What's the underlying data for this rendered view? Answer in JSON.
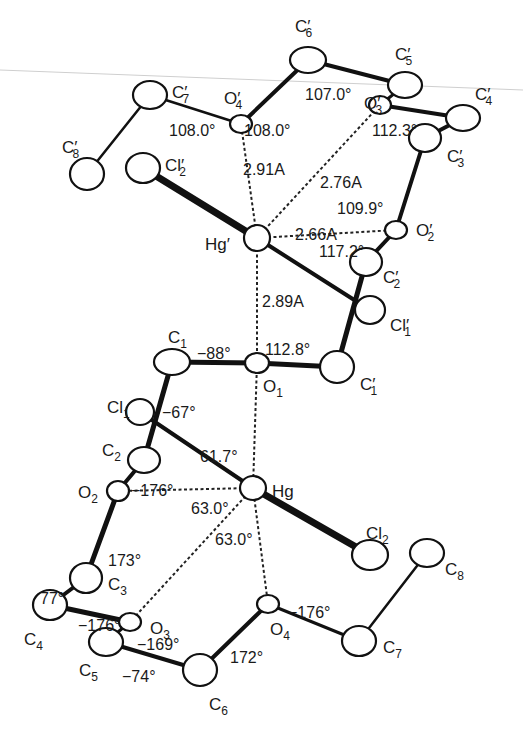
{
  "figure": {
    "type": "molecular-structure"
  },
  "atoms": [
    {
      "id": "C6p",
      "element": "C",
      "sub": "6",
      "prime": true
    },
    {
      "id": "C5p",
      "element": "C",
      "sub": "5",
      "prime": true
    },
    {
      "id": "C7p",
      "element": "C",
      "sub": "7",
      "prime": true
    },
    {
      "id": "O4p",
      "element": "O",
      "sub": "4",
      "prime": true
    },
    {
      "id": "O3p",
      "element": "O",
      "sub": "3",
      "prime": true
    },
    {
      "id": "C4p",
      "element": "C",
      "sub": "4",
      "prime": true
    },
    {
      "id": "C3p",
      "element": "C",
      "sub": "3",
      "prime": true
    },
    {
      "id": "C8p",
      "element": "C",
      "sub": "8",
      "prime": true
    },
    {
      "id": "Cl2p",
      "element": "Cl",
      "sub": "2",
      "prime": true
    },
    {
      "id": "Hgp",
      "element": "Hg",
      "sub": "",
      "prime": true
    },
    {
      "id": "O2p",
      "element": "O",
      "sub": "2",
      "prime": true
    },
    {
      "id": "C2p",
      "element": "C",
      "sub": "2",
      "prime": true
    },
    {
      "id": "Cl1p",
      "element": "Cl",
      "sub": "1",
      "prime": true
    },
    {
      "id": "C1",
      "element": "C",
      "sub": "1",
      "prime": false
    },
    {
      "id": "O1",
      "element": "O",
      "sub": "1",
      "prime": false
    },
    {
      "id": "C1p",
      "element": "C",
      "sub": "1",
      "prime": true
    },
    {
      "id": "Cl1",
      "element": "Cl",
      "sub": "1",
      "prime": false
    },
    {
      "id": "C2",
      "element": "C",
      "sub": "2",
      "prime": false
    },
    {
      "id": "Hg",
      "element": "Hg",
      "sub": "",
      "prime": false
    },
    {
      "id": "O2",
      "element": "O",
      "sub": "2",
      "prime": false
    },
    {
      "id": "Cl2",
      "element": "Cl",
      "sub": "2",
      "prime": false
    },
    {
      "id": "C8",
      "element": "C",
      "sub": "8",
      "prime": false
    },
    {
      "id": "C3",
      "element": "C",
      "sub": "3",
      "prime": false
    },
    {
      "id": "C4",
      "element": "C",
      "sub": "4",
      "prime": false
    },
    {
      "id": "O3",
      "element": "O",
      "sub": "3",
      "prime": false
    },
    {
      "id": "O4",
      "element": "O",
      "sub": "4",
      "prime": false
    },
    {
      "id": "C5",
      "element": "C",
      "sub": "5",
      "prime": false
    },
    {
      "id": "C7",
      "element": "C",
      "sub": "7",
      "prime": false
    },
    {
      "id": "C6",
      "element": "C",
      "sub": "6",
      "prime": false
    }
  ],
  "bonds": [
    [
      "C8p",
      "C7p"
    ],
    [
      "C7p",
      "O4p"
    ],
    [
      "O4p",
      "C6p"
    ],
    [
      "C6p",
      "C5p"
    ],
    [
      "C5p",
      "O3p"
    ],
    [
      "O3p",
      "C4p"
    ],
    [
      "C4p",
      "C3p"
    ],
    [
      "C3p",
      "O2p"
    ],
    [
      "O2p",
      "C2p"
    ],
    [
      "C2p",
      "C1p"
    ],
    [
      "C1p",
      "O1"
    ],
    [
      "O1",
      "C1"
    ],
    [
      "C1",
      "C2"
    ],
    [
      "C2",
      "O2"
    ],
    [
      "O2",
      "C3"
    ],
    [
      "C3",
      "C4"
    ],
    [
      "C4",
      "O3"
    ],
    [
      "O3",
      "C5"
    ],
    [
      "C5",
      "C6"
    ],
    [
      "C6",
      "O4"
    ],
    [
      "O4",
      "C7"
    ],
    [
      "C7",
      "C8"
    ],
    [
      "Cl2p",
      "Hgp"
    ],
    [
      "Hgp",
      "Cl1p"
    ],
    [
      "Cl1",
      "Hg"
    ],
    [
      "Hg",
      "Cl2"
    ]
  ],
  "contacts": [
    {
      "from": "Hgp",
      "to": "O4p",
      "distance": "2.91A"
    },
    {
      "from": "Hgp",
      "to": "O3p",
      "distance": "2.76A"
    },
    {
      "from": "Hgp",
      "to": "O2p",
      "distance": "2.66A"
    },
    {
      "from": "Hgp",
      "to": "O1",
      "distance": "2.89A"
    },
    {
      "from": "Hg",
      "to": "O1",
      "distance": ""
    },
    {
      "from": "Hg",
      "to": "O2",
      "distance": ""
    },
    {
      "from": "Hg",
      "to": "O3",
      "distance": ""
    },
    {
      "from": "Hg",
      "to": "O4",
      "distance": ""
    }
  ],
  "measurements": [
    "107.0°",
    "108.0°",
    "108.0°",
    "112.3°",
    "2.91A",
    "2.76A",
    "109.9°",
    "2.66A",
    "117.2°",
    "2.89A",
    "−88°",
    "112.8°",
    "−67°",
    "61.7°",
    "−176°",
    "63.0°",
    "63.0°",
    "173°",
    "77°",
    "−176°",
    "−169°",
    "−74°",
    "172°",
    "−176°"
  ]
}
